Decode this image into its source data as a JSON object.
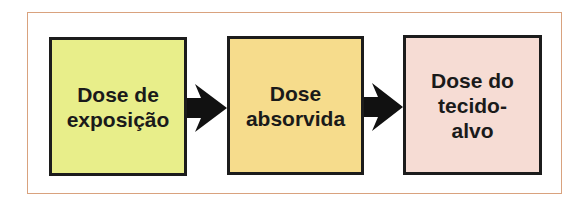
{
  "diagram": {
    "type": "flow",
    "direction": "left-to-right",
    "nodes": [
      {
        "id": "exposure",
        "label": "Dose de\nexposição",
        "color": "#e8ee8a"
      },
      {
        "id": "absorbed",
        "label": "Dose\nabsorvida",
        "color": "#f6dc8c"
      },
      {
        "id": "target",
        "label": "Dose do\ntecido-\nalvo",
        "color": "#f6dcd4"
      }
    ],
    "edges": [
      {
        "from": "exposure",
        "to": "absorbed"
      },
      {
        "from": "absorbed",
        "to": "target"
      }
    ],
    "frame_color": "#d9a27e"
  }
}
